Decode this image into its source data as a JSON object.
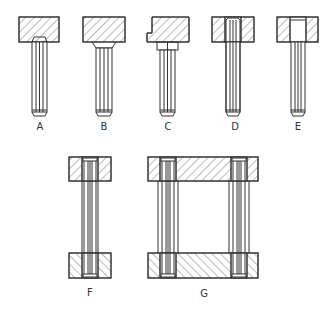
{
  "figure": {
    "type": "technical drawing - guide pin / dowel variants",
    "labels": {
      "A": "A",
      "B": "B",
      "C": "C",
      "D": "D",
      "E": "E",
      "F": "F",
      "G": "G"
    },
    "colors": {
      "line": "#333333",
      "hatch": "#555555",
      "background": "#ffffff"
    }
  }
}
